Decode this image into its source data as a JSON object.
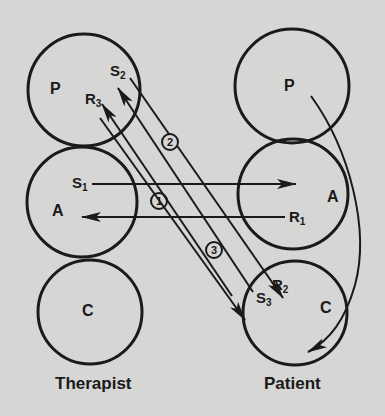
{
  "diagram": {
    "type": "transactional-analysis",
    "left_column": {
      "caption": "Therapist",
      "states": [
        {
          "id": "P",
          "label": "P"
        },
        {
          "id": "A",
          "label": "A"
        },
        {
          "id": "C",
          "label": "C"
        }
      ]
    },
    "right_column": {
      "caption": "Patient",
      "states": [
        {
          "id": "P",
          "label": "P"
        },
        {
          "id": "A",
          "label": "A"
        },
        {
          "id": "C",
          "label": "C"
        }
      ]
    },
    "transactions": [
      {
        "number": "1",
        "stimulus": "S",
        "stimulus_sub": "1",
        "response": "R",
        "response_sub": "1",
        "from": "Therapist A",
        "to": "Patient A"
      },
      {
        "number": "2",
        "stimulus": "S",
        "stimulus_sub": "2",
        "response": "R",
        "response_sub": "3",
        "from": "Patient C",
        "to": "Therapist P"
      },
      {
        "number": "3",
        "stimulus": "S",
        "stimulus_sub": "3",
        "response": "R",
        "response_sub": "2",
        "from": "Therapist P",
        "to": "Patient C"
      }
    ],
    "colors": {
      "ink": "#1a1a1a",
      "paper": "#d6d6d4"
    }
  }
}
